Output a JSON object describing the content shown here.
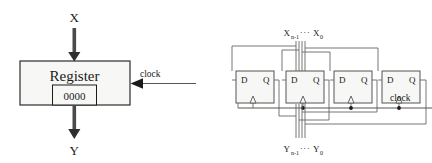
{
  "figure": {
    "name": "register-block-and-dff-implementation",
    "colors": {
      "stroke": "#1a1a1a",
      "thin_stroke": "#555555",
      "box_fill": "#f7f7f5",
      "arrow_fill": "#4a4a4a",
      "background": "#ffffff"
    },
    "left_diagram": {
      "name": "register-block-diagram",
      "input_label": "X",
      "output_label": "Y",
      "block_label": "Register",
      "stored_value": "0000",
      "clock_label": "clock"
    },
    "right_diagram": {
      "name": "d-flip-flop-register-implementation",
      "input_bus_base": "X",
      "input_bus_sub_high": "n-1",
      "input_bus_dots": "···",
      "input_bus_sub_low": "0",
      "output_bus_base": "Y",
      "output_bus_sub_high": "n-1",
      "output_bus_dots": "···",
      "output_bus_sub_low": "0",
      "clock_label": "clock",
      "flipflops": [
        {
          "d_label": "D",
          "q_label": "Q"
        },
        {
          "d_label": "D",
          "q_label": "Q"
        },
        {
          "d_label": "D",
          "q_label": "Q"
        },
        {
          "d_label": "D",
          "q_label": "Q"
        }
      ]
    }
  }
}
